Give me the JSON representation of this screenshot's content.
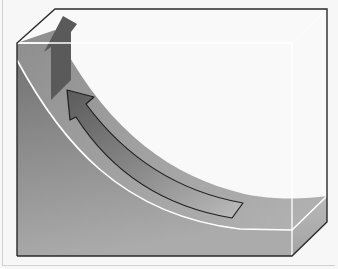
{
  "diagram": {
    "type": "3d-box-cutaway",
    "colors": {
      "background": "#f7f7f7",
      "box_back_face": "#f9f9f9",
      "box_outline": "#2a2a2a",
      "front_face_top": "#777777",
      "front_face_bottom": "#a9a9a9",
      "curve_band": "#a5a5a5",
      "curve_highlight": "#ffffff",
      "vertical_arrow": "#5a5a5a",
      "curved_arrow_head": "#5e5e5e",
      "curved_arrow_tail": "#b4b4b4",
      "right_side_face": "#b0b0b0"
    },
    "elements": [
      {
        "name": "box",
        "label": ""
      },
      {
        "name": "curved-surface",
        "label": ""
      },
      {
        "name": "curved-arrow",
        "direction": "up-left along curve",
        "label": ""
      },
      {
        "name": "vertical-arrow",
        "direction": "up",
        "label": ""
      }
    ]
  }
}
